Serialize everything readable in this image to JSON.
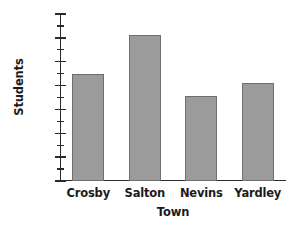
{
  "chart_data": {
    "type": "bar",
    "title": "",
    "subtitle": "",
    "xlabel": "Town",
    "ylabel": "Students",
    "categories": [
      "Crosby",
      "Salton",
      "Nevins",
      "Yardley"
    ],
    "values": [
      4500,
      6100,
      3550,
      4100
    ],
    "series": [
      {
        "name": "Students",
        "values": [
          4500,
          6100,
          3550,
          4100
        ]
      }
    ],
    "ylim": [
      0,
      7000
    ],
    "y_major_ticks": [
      0,
      1000,
      2000,
      3000,
      4000,
      5000,
      6000,
      7000
    ],
    "y_tick_labels": [
      "0",
      "1,000",
      "2,000",
      "3,000",
      "4,000",
      "5,000",
      "6,000",
      "7,000"
    ],
    "y_minor_tick_interval": 500,
    "grid": false,
    "legend": false,
    "legend_position": "none",
    "bar_fill_color": "#9b9b9b",
    "bar_border_color": "#6e6e6e",
    "axis_color": "#2b2b2b",
    "background_color": "#ffffff",
    "annotations": []
  }
}
